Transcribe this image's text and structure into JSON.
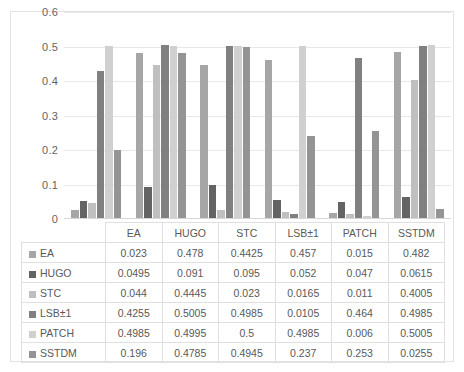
{
  "chart_data": {
    "type": "bar",
    "title": "",
    "xlabel": "",
    "ylabel": "",
    "ylim": [
      0,
      0.6
    ],
    "ytick_values": [
      0.6,
      0.5,
      0.4,
      0.3,
      0.2,
      0.1,
      0
    ],
    "ytick_labels": [
      "0.6",
      "0.5",
      "0.4",
      "0.3",
      "0.2",
      "0.1",
      "0"
    ],
    "grid": true,
    "legend_position": "table-first-column",
    "categories": [
      "EA",
      "HUGO",
      "STC",
      "LSB±1",
      "PATCH",
      "SSTDM"
    ],
    "series": [
      {
        "name": "EA",
        "color": "#a6a6a6",
        "values": [
          0.023,
          0.478,
          0.4425,
          0.457,
          0.015,
          0.482
        ]
      },
      {
        "name": "HUGO",
        "color": "#636363",
        "values": [
          0.0495,
          0.091,
          0.095,
          0.052,
          0.047,
          0.0615
        ]
      },
      {
        "name": "STC",
        "color": "#bfbfbf",
        "values": [
          0.044,
          0.4445,
          0.023,
          0.0165,
          0.011,
          0.4005
        ]
      },
      {
        "name": "LSB±1",
        "color": "#808080",
        "values": [
          0.4255,
          0.5005,
          0.4985,
          0.0105,
          0.464,
          0.4985
        ]
      },
      {
        "name": "PATCH",
        "color": "#d0d0d0",
        "values": [
          0.4985,
          0.4995,
          0.5,
          0.4985,
          0.006,
          0.5005
        ]
      },
      {
        "name": "SSTDM",
        "color": "#949494",
        "values": [
          0.196,
          0.4785,
          0.4945,
          0.237,
          0.253,
          0.0255
        ]
      }
    ]
  },
  "table": {
    "corner_label": "",
    "column_headers": [
      "EA",
      "HUGO",
      "STC",
      "LSB±1",
      "PATCH",
      "SSTDM"
    ],
    "rows": [
      {
        "label": "EA",
        "swatch_color": "#a6a6a6",
        "cells": [
          "0.023",
          "0.478",
          "0.4425",
          "0.457",
          "0.015",
          "0.482"
        ]
      },
      {
        "label": "HUGO",
        "swatch_color": "#636363",
        "cells": [
          "0.0495",
          "0.091",
          "0.095",
          "0.052",
          "0.047",
          "0.0615"
        ]
      },
      {
        "label": "STC",
        "swatch_color": "#bfbfbf",
        "cells": [
          "0.044",
          "0.4445",
          "0.023",
          "0.0165",
          "0.011",
          "0.4005"
        ]
      },
      {
        "label": "LSB±1",
        "swatch_color": "#808080",
        "cells": [
          "0.4255",
          "0.5005",
          "0.4985",
          "0.0105",
          "0.464",
          "0.4985"
        ]
      },
      {
        "label": "PATCH",
        "swatch_color": "#d0d0d0",
        "cells": [
          "0.4985",
          "0.4995",
          "0.5",
          "0.4985",
          "0.006",
          "0.5005"
        ]
      },
      {
        "label": "SSTDM",
        "swatch_color": "#949494",
        "cells": [
          "0.196",
          "0.4785",
          "0.4945",
          "0.237",
          "0.253",
          "0.0255"
        ]
      }
    ]
  }
}
